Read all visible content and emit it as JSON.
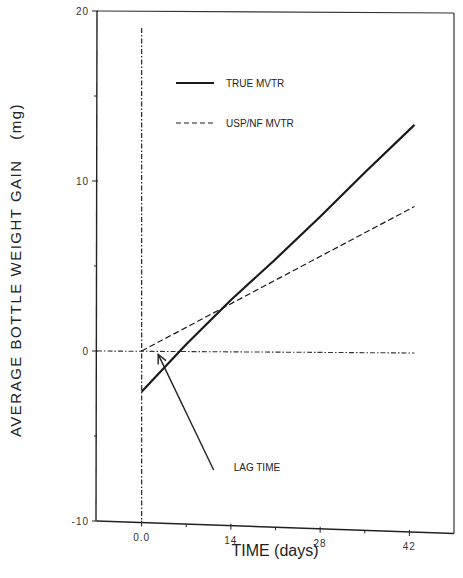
{
  "chart_data": {
    "type": "line",
    "title": "",
    "xlabel": "TIME (days)",
    "ylabel": "AVERAGE BOTTLE WEIGHT GAIN (mg)",
    "ylabel_main": "AVERAGE BOTTLE WEIGHT GAIN",
    "ylabel_unit": "(mg)",
    "xlim": [
      -7,
      49
    ],
    "ylim": [
      -10,
      20
    ],
    "xticks": [
      0,
      14,
      28,
      42
    ],
    "xtick_labels": [
      "0.0",
      "14",
      "28",
      "42"
    ],
    "xminor_ticks": [
      7,
      21,
      35
    ],
    "yticks": [
      -10,
      0,
      10,
      20
    ],
    "ytick_labels": [
      "-10",
      "0",
      "10",
      "20"
    ],
    "yminor_ticks": [
      -5,
      5,
      15
    ],
    "grid": false,
    "legend_position": "top-left",
    "series": [
      {
        "name": "TRUE MVTR",
        "style": "solid",
        "color": "#1a1a1a",
        "x": [
          0,
          7,
          14,
          21,
          28,
          35,
          42.8
        ],
        "y": [
          -2.4,
          0.4,
          3.0,
          5.4,
          7.9,
          10.5,
          13.3
        ]
      },
      {
        "name": "USP/NF MVTR",
        "style": "dashed",
        "color": "#1a1a1a",
        "x": [
          0,
          42.8
        ],
        "y": [
          0,
          8.5
        ]
      }
    ],
    "reference_lines": [
      {
        "name": "time-zero",
        "orientation": "vertical",
        "x": 0,
        "y_range": [
          -10,
          19
        ],
        "style": "dash-dot"
      },
      {
        "name": "zero-gain",
        "orientation": "horizontal",
        "y": 0,
        "x_range": [
          -7,
          42.8
        ],
        "style": "dash-dot"
      }
    ],
    "annotations": [
      {
        "text": "LAG TIME",
        "arrow_from": [
          11.3,
          -7
        ],
        "arrow_to": [
          2.6,
          -0.2
        ]
      }
    ]
  }
}
